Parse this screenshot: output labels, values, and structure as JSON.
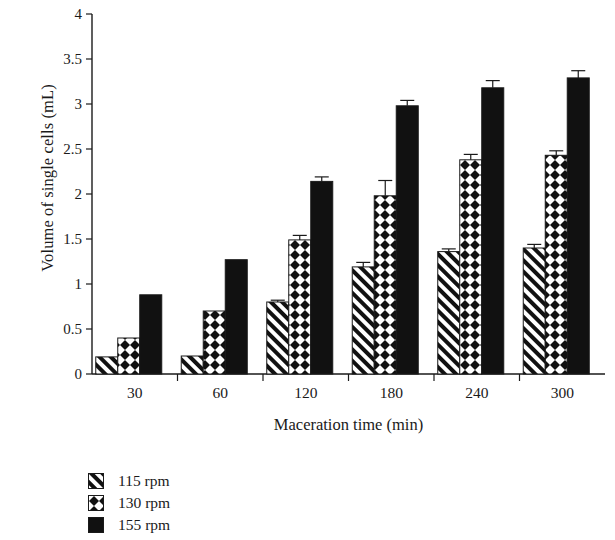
{
  "chart_data": {
    "type": "bar",
    "title": "",
    "xlabel": "Maceration time (min)",
    "ylabel": "Volume of single cells (mL)",
    "categories": [
      "30",
      "60",
      "120",
      "180",
      "240",
      "300"
    ],
    "ylim": [
      0,
      4
    ],
    "ytick_labels": [
      "0",
      "0.5",
      "1",
      "1.5",
      "2",
      "2.5",
      "3",
      "3.5",
      "4"
    ],
    "ytick_values": [
      0,
      0.5,
      1,
      1.5,
      2,
      2.5,
      3,
      3.5,
      4
    ],
    "grid": false,
    "legend_position": "below-left",
    "series": [
      {
        "name": "115 rpm",
        "pattern": "diagonal-hatch",
        "values": [
          0.19,
          0.2,
          0.8,
          1.19,
          1.36,
          1.4
        ],
        "errors": [
          0.0,
          0.0,
          0.02,
          0.05,
          0.03,
          0.04
        ]
      },
      {
        "name": "130 rpm",
        "pattern": "crosshatch-dots",
        "values": [
          0.4,
          0.7,
          1.49,
          1.98,
          2.38,
          2.43
        ],
        "errors": [
          0.0,
          0.0,
          0.05,
          0.17,
          0.06,
          0.05
        ]
      },
      {
        "name": "155 rpm",
        "pattern": "solid-black",
        "values": [
          0.88,
          1.27,
          2.14,
          2.98,
          3.18,
          3.29
        ],
        "errors": [
          0.0,
          0.0,
          0.05,
          0.06,
          0.08,
          0.08
        ]
      }
    ]
  },
  "legend": {
    "items": [
      {
        "label": "115 rpm",
        "pattern": "diagonal-hatch"
      },
      {
        "label": "130 rpm",
        "pattern": "crosshatch-dots"
      },
      {
        "label": "155 rpm",
        "pattern": "solid-black"
      }
    ]
  },
  "colors": {
    "axis": "#1a1a1a",
    "bar_fill": "#111111",
    "background": "#ffffff"
  }
}
